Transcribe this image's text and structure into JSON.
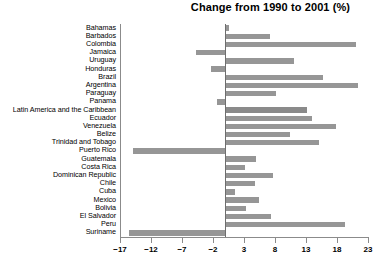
{
  "chart": {
    "title": "Change from 1990 to 2001 (%)"
  },
  "axis": {
    "tick_labels": [
      "−17",
      "−12",
      "−7",
      "−2",
      "3",
      "8",
      "13",
      "18",
      "23"
    ]
  },
  "chart_data": {
    "type": "bar",
    "orientation": "horizontal",
    "title": "Change from 1990 to 2001 (%)",
    "xlabel": "",
    "ylabel": "",
    "xlim": [
      -17,
      23
    ],
    "xticks": [
      -17,
      -12,
      -7,
      -2,
      3,
      8,
      13,
      18,
      23
    ],
    "grid": false,
    "legend": null,
    "zero_line": 0,
    "bar_color": "#969696",
    "highlight_color": "#8a8a8a",
    "categories": [
      "Bahamas",
      "Barbados",
      "Colombia",
      "Jamaica",
      "Uruguay",
      "Honduras",
      "Brazil",
      "Argentina",
      "Paraguay",
      "Panama",
      "Latin America and the Caribbean",
      "Ecuador",
      "Venezuela",
      "Belize",
      "Trinidad and Tobago",
      "Puerto Rico",
      "Guatemala",
      "Costa Rica",
      "Dominican Republic",
      "Chile",
      "Cuba",
      "Mexico",
      "Bolivia",
      "El Salvador",
      "Peru",
      "Suriname"
    ],
    "values": [
      0.6,
      7.2,
      21.0,
      -4.8,
      11.0,
      -2.4,
      15.8,
      21.4,
      8.1,
      -1.3,
      13.2,
      13.9,
      17.8,
      10.4,
      15.1,
      -14.9,
      5.0,
      3.2,
      7.6,
      4.8,
      1.6,
      5.4,
      3.3,
      7.4,
      19.3,
      -15.6
    ],
    "highlight_index": 10
  }
}
